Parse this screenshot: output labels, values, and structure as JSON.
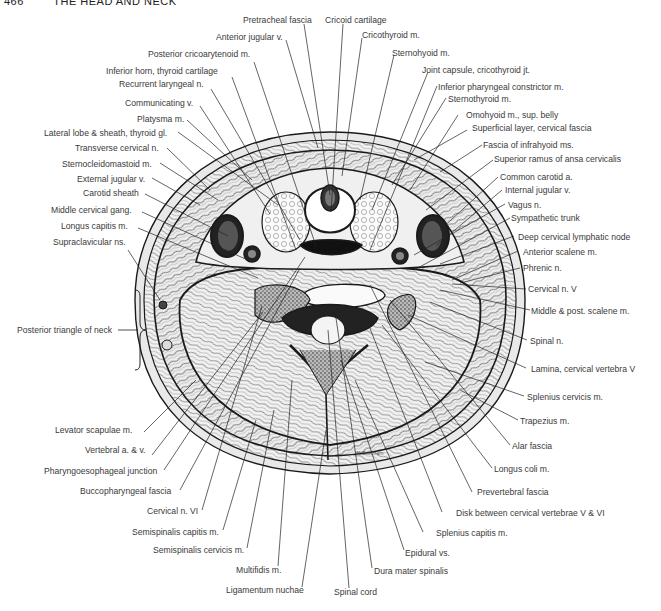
{
  "header": {
    "page_number": "466",
    "running_title": "THE HEAD AND NECK"
  },
  "figure": {
    "artist_signature": "W. Beecham",
    "colors": {
      "ink": "#1a1a1a",
      "label_text": "#3a3a3a",
      "background": "#ffffff",
      "tissue_fill": "#e6e6e6"
    }
  },
  "labels": {
    "top": [
      {
        "id": "pretracheal-fascia",
        "text": "Pretracheal fascia"
      },
      {
        "id": "cricoid-cartilage",
        "text": "Cricoid cartilage"
      },
      {
        "id": "anterior-jugular-v",
        "text": "Anterior jugular v."
      },
      {
        "id": "cricothyroid-m",
        "text": "Cricothyroid m."
      },
      {
        "id": "posterior-cricoarytenoid-m",
        "text": "Posterior cricoarytenoid m."
      },
      {
        "id": "sternohyoid-m",
        "text": "Sternohyoid m."
      }
    ],
    "left": [
      {
        "id": "inferior-horn-thyroid-cartilage",
        "text": "Inferior horn, thyroid cartilage"
      },
      {
        "id": "recurrent-laryngeal-n",
        "text": "Recurrent laryngeal n."
      },
      {
        "id": "communicating-v",
        "text": "Communicating v."
      },
      {
        "id": "platysma-m",
        "text": "Platysma m."
      },
      {
        "id": "lateral-lobe-sheath-thyroid-gl",
        "text": "Lateral lobe & sheath, thyroid gl."
      },
      {
        "id": "transverse-cervical-n",
        "text": "Transverse cervical n."
      },
      {
        "id": "sternocleidomastoid-m",
        "text": "Sternocleidomastoid m."
      },
      {
        "id": "external-jugular-v",
        "text": "External jugular v."
      },
      {
        "id": "carotid-sheath",
        "text": "Carotid sheath"
      },
      {
        "id": "middle-cervical-gang",
        "text": "Middle cervical gang."
      },
      {
        "id": "longus-capitis-m",
        "text": "Longus capitis m."
      },
      {
        "id": "supraclavicular-ns",
        "text": "Supraclavicular ns."
      },
      {
        "id": "posterior-triangle-of-neck",
        "text": "Posterior triangle of neck"
      },
      {
        "id": "levator-scapulae-m",
        "text": "Levator scapulae m."
      },
      {
        "id": "vertebral-a-v",
        "text": "Vertebral a. & v."
      },
      {
        "id": "pharyngoesophageal-junction",
        "text": "Pharyngoesophageal junction"
      },
      {
        "id": "buccopharyngeal-fascia",
        "text": "Buccopharyngeal fascia"
      },
      {
        "id": "cervical-n-vi",
        "text": "Cervical n. VI"
      },
      {
        "id": "semispinalis-capitis-m",
        "text": "Semispinalis capitis m."
      },
      {
        "id": "semispinalis-cervicis-m",
        "text": "Semispinalis cervicis m."
      },
      {
        "id": "multifidis-m",
        "text": "Multifidis m."
      },
      {
        "id": "ligamentum-nuchae",
        "text": "Ligamentum nuchae"
      }
    ],
    "right": [
      {
        "id": "joint-capsule-cricothyroid-jt",
        "text": "Joint capsule, cricothyroid jt."
      },
      {
        "id": "inferior-pharyngeal-constrictor-m",
        "text": "Inferior pharyngeal constrictor m."
      },
      {
        "id": "sternothyroid-m",
        "text": "Sternothyroid m."
      },
      {
        "id": "omohyoid-m-sup-belly",
        "text": "Omohyoid m., sup. belly"
      },
      {
        "id": "superficial-layer-cervical-fascia",
        "text": "Superficial layer, cervical fascia"
      },
      {
        "id": "fascia-of-infrahyoid-ms",
        "text": "Fascia of infrahyoid ms."
      },
      {
        "id": "superior-ramus-ansa-cervicalis",
        "text": "Superior ramus of ansa cervicalis"
      },
      {
        "id": "common-carotid-a",
        "text": "Common carotid a."
      },
      {
        "id": "internal-jugular-v",
        "text": "Internal jugular v."
      },
      {
        "id": "vagus-n",
        "text": "Vagus n."
      },
      {
        "id": "sympathetic-trunk",
        "text": "Sympathetic trunk"
      },
      {
        "id": "deep-cervical-lymphatic-node",
        "text": "Deep cervical lymphatic node"
      },
      {
        "id": "anterior-scalene-m",
        "text": "Anterior scalene m."
      },
      {
        "id": "phrenic-n",
        "text": "Phrenic n."
      },
      {
        "id": "cervical-n-v",
        "text": "Cervical n. V"
      },
      {
        "id": "middle-post-scalene-m",
        "text": "Middle & post. scalene m."
      },
      {
        "id": "spinal-n",
        "text": "Spinal n."
      },
      {
        "id": "lamina-cervical-vertebra-v",
        "text": "Lamina, cervical vertebra V"
      },
      {
        "id": "splenius-cervicis-m",
        "text": "Splenius cervicis m."
      },
      {
        "id": "trapezius-m",
        "text": "Trapezius m."
      },
      {
        "id": "alar-fascia",
        "text": "Alar fascia"
      },
      {
        "id": "longus-coli-m",
        "text": "Longus coli m."
      },
      {
        "id": "prevertebral-fascia",
        "text": "Prevertebral fascia"
      },
      {
        "id": "disk-between-cervical-vertebrae",
        "text": "Disk between cervical vertebrae V & VI"
      },
      {
        "id": "splenius-capitis-m",
        "text": "Splenius capitis m."
      },
      {
        "id": "epidural-vs",
        "text": "Epidural vs."
      },
      {
        "id": "dura-mater-spinalis",
        "text": "Dura mater spinalis"
      },
      {
        "id": "spinal-cord",
        "text": "Spinal cord"
      }
    ]
  }
}
